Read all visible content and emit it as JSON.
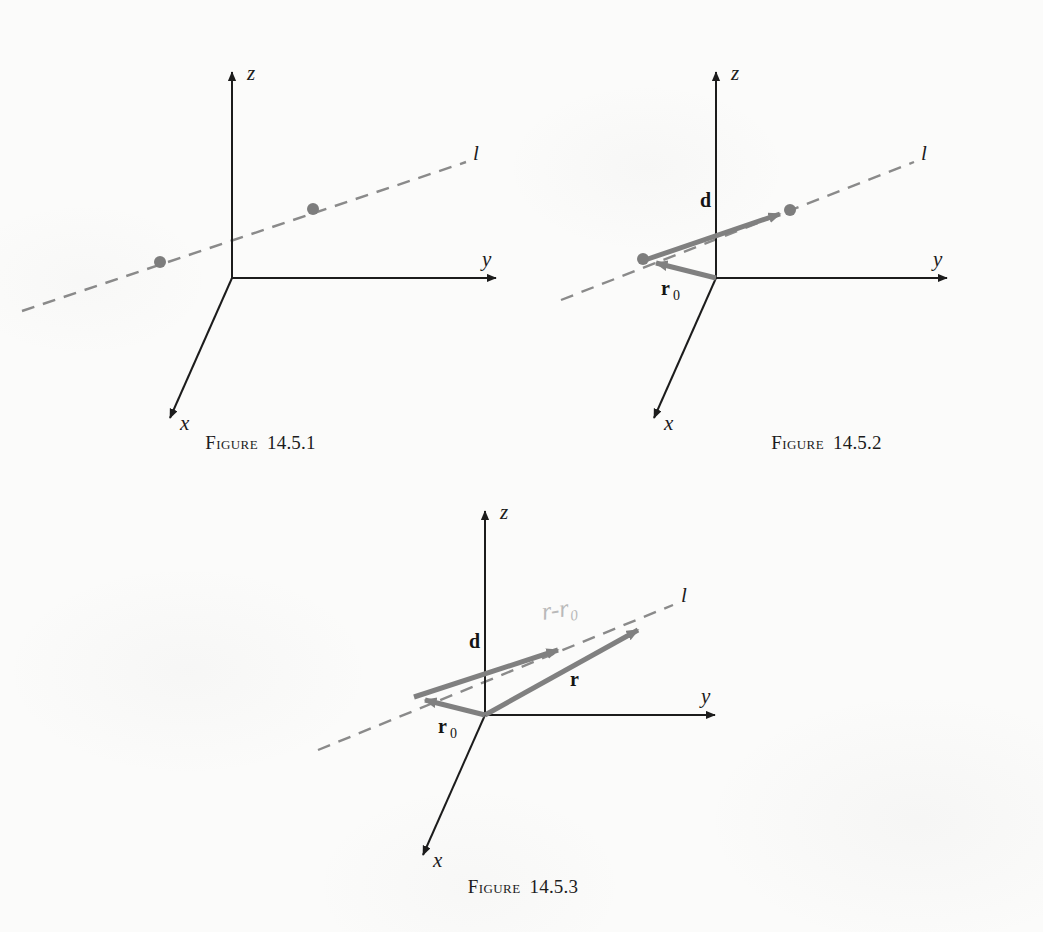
{
  "page": {
    "background_color": "#fbfbfa",
    "ink_color": "#1c1c1c",
    "vector_color": "#808080",
    "dashed_line_color": "#8a8a8a",
    "pencil_note_color": "#b9b9b9"
  },
  "figures": [
    {
      "id": "figure-1",
      "caption_word": "Figure",
      "caption_number": "14.5.1",
      "axis_labels": {
        "x": "x",
        "y": "y",
        "z": "z"
      },
      "line_label": "l",
      "points": [
        {
          "name": "point-a"
        },
        {
          "name": "point-b"
        }
      ],
      "vectors": []
    },
    {
      "id": "figure-2",
      "caption_word": "Figure",
      "caption_number": "14.5.2",
      "axis_labels": {
        "x": "x",
        "y": "y",
        "z": "z"
      },
      "line_label": "l",
      "points": [
        {
          "name": "point-r0"
        },
        {
          "name": "point-d-tip"
        }
      ],
      "vectors": [
        {
          "name": "vector-d",
          "label": "d",
          "subscript": ""
        },
        {
          "name": "vector-r0",
          "label": "r",
          "subscript": "0"
        }
      ]
    },
    {
      "id": "figure-3",
      "caption_word": "Figure",
      "caption_number": "14.5.3",
      "axis_labels": {
        "x": "x",
        "y": "y",
        "z": "z"
      },
      "line_label": "l",
      "points": [],
      "vectors": [
        {
          "name": "vector-d",
          "label": "d",
          "subscript": ""
        },
        {
          "name": "vector-r",
          "label": "r",
          "subscript": ""
        },
        {
          "name": "vector-r0",
          "label": "r",
          "subscript": "0"
        }
      ],
      "handwritten_note": "r-r₀"
    }
  ]
}
